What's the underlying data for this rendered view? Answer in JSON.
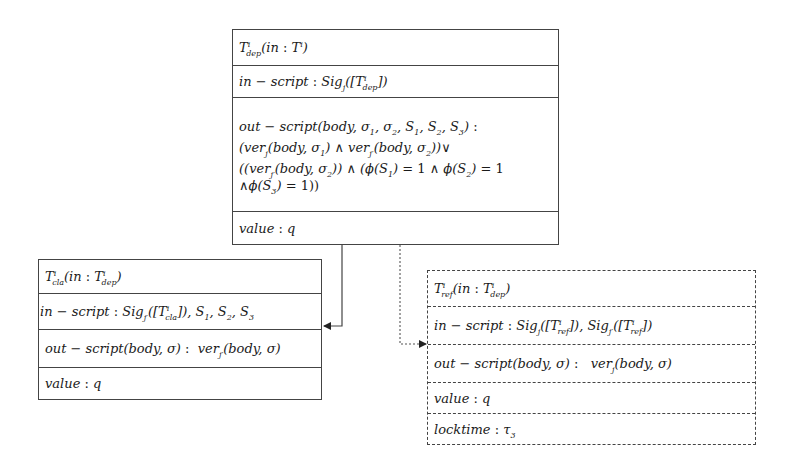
{
  "diagram": {
    "type": "transaction-structure",
    "boxes": {
      "deposit": {
        "style": "solid",
        "header": "Tⁱ_dep(in : Tⁱ)",
        "in_script": "in − script : Sig_j([Tⁱ_dep])",
        "out_script_lines": [
          "out − script(body, σ₁, σ₂, S₁, S₂, S₃) :",
          "(ver_j(body, σ₁) ∧ ver_j′(body, σ₂))∨",
          "((ver_j′(body, σ₂)) ∧ (ϕ(S₁) = 1 ∧ ϕ(S₂) = 1",
          "∧ϕ(S₃) = 1))"
        ],
        "value": "value : q"
      },
      "claim": {
        "style": "solid",
        "header": "Tⁱ_cla(in : Tⁱ_dep)",
        "in_script": "in − script : Sig_j′([Tⁱ_cla]), S₁, S₂, S₃",
        "out_script": "out − script(body, σ) :  ver_j′(body, σ)",
        "value": "value : q"
      },
      "refund": {
        "style": "dashed",
        "header": "Tⁱ_ref(in : Tⁱ_dep)",
        "in_script": "in − script : Sig_j([Tⁱ_ref]), Sig_j′([Tⁱ_ref])",
        "out_script": "out − script(body, σ) :   ver_j(body, σ)",
        "value": "value : q",
        "locktime": "locktime : τ₃"
      }
    },
    "edges": [
      {
        "from": "deposit",
        "to": "claim",
        "style": "solid",
        "arrow": "end"
      },
      {
        "from": "deposit",
        "to": "refund",
        "style": "dotted",
        "arrow": "end"
      }
    ]
  }
}
